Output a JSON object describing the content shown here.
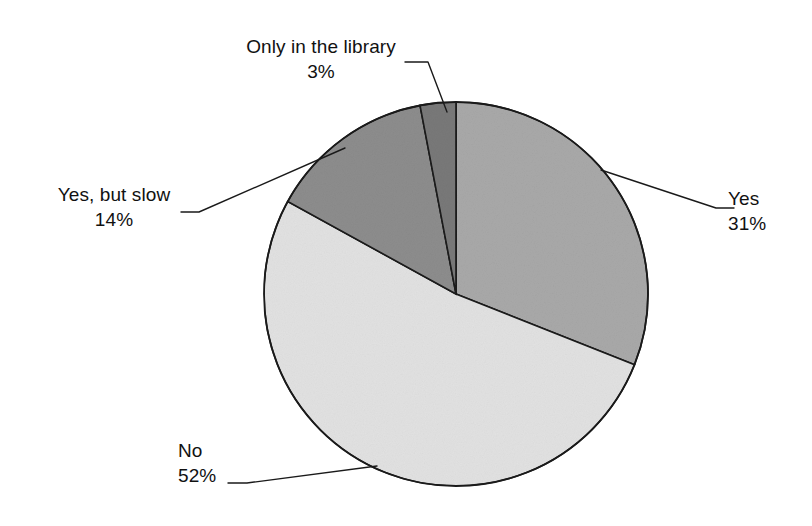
{
  "chart_data": {
    "type": "pie",
    "title": "",
    "subtitle": "",
    "xlabel": "",
    "ylabel": "",
    "legend_position": "none",
    "grid": false,
    "labels_style": "callout-with-leader-lines",
    "start_angle_deg": 0,
    "direction": "clockwise",
    "categories": [
      "Yes",
      "No",
      "Yes, but slow",
      "Only in the library"
    ],
    "values": [
      31,
      52,
      14,
      3
    ],
    "value_unit": "percent",
    "value_labels": [
      "31%",
      "52%",
      "14%",
      "3%"
    ],
    "slices": [
      {
        "name": "Yes",
        "value": 31,
        "value_label": "31%",
        "color": "#a9a9a9",
        "start_deg": 0,
        "end_deg": 111.6
      },
      {
        "name": "No",
        "value": 52,
        "value_label": "52%",
        "color": "#e2e2e2",
        "start_deg": 111.6,
        "end_deg": 298.8
      },
      {
        "name": "Yes, but slow",
        "value": 14,
        "value_label": "14%",
        "color": "#8d8d8d",
        "start_deg": 298.8,
        "end_deg": 349.2
      },
      {
        "name": "Only in the library",
        "value": 3,
        "value_label": "3%",
        "color": "#797979",
        "start_deg": 349.2,
        "end_deg": 360
      }
    ],
    "outline_color": "#1a1a1a",
    "background_color": "#ffffff"
  },
  "labels": {
    "only_library": {
      "name": "Only in the library",
      "value": "3%"
    },
    "yes_but_slow": {
      "name": "Yes, but slow",
      "value": "14%"
    },
    "yes": {
      "name": "Yes",
      "value": "31%"
    },
    "no": {
      "name": "No",
      "value": "52%"
    }
  }
}
